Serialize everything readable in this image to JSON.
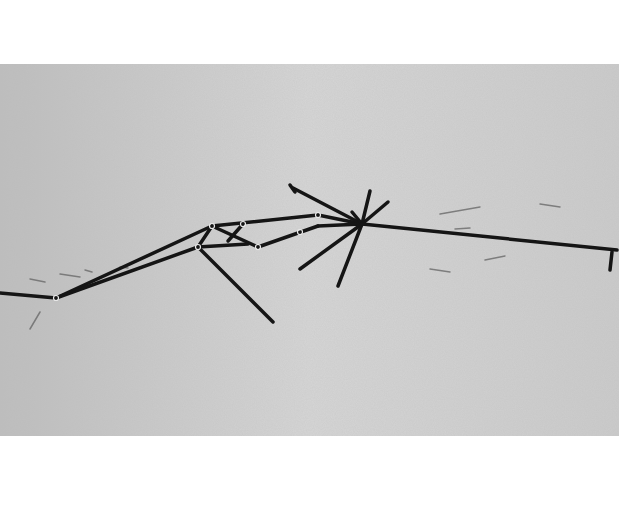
{
  "image": {
    "description": "Grayscale photograph of dark thin sticks/lines radiating across a light gray paper-textured surface",
    "background_color": "#cfcfcf",
    "page_color": "#ffffff",
    "stroke_color": "#151515",
    "photo_bounds": {
      "x": 0,
      "y": 64,
      "width": 619,
      "height": 372
    }
  },
  "segments": [
    {
      "x1": 0,
      "y1": 229,
      "x2": 56,
      "y2": 234
    },
    {
      "x1": 56,
      "y1": 234,
      "x2": 212,
      "y2": 162
    },
    {
      "x1": 56,
      "y1": 234,
      "x2": 198,
      "y2": 183
    },
    {
      "x1": 212,
      "y1": 162,
      "x2": 318,
      "y2": 151
    },
    {
      "x1": 198,
      "y1": 183,
      "x2": 212,
      "y2": 162
    },
    {
      "x1": 198,
      "y1": 183,
      "x2": 273,
      "y2": 258
    },
    {
      "x1": 212,
      "y1": 162,
      "x2": 258,
      "y2": 183
    },
    {
      "x1": 198,
      "y1": 183,
      "x2": 248,
      "y2": 180
    },
    {
      "x1": 243,
      "y1": 160,
      "x2": 228,
      "y2": 177
    },
    {
      "x1": 258,
      "y1": 183,
      "x2": 318,
      "y2": 162
    },
    {
      "x1": 318,
      "y1": 151,
      "x2": 362,
      "y2": 160
    },
    {
      "x1": 318,
      "y1": 162,
      "x2": 362,
      "y2": 160
    },
    {
      "x1": 293,
      "y1": 124,
      "x2": 362,
      "y2": 160
    },
    {
      "x1": 290,
      "y1": 121,
      "x2": 295,
      "y2": 128
    },
    {
      "x1": 362,
      "y1": 160,
      "x2": 370,
      "y2": 127
    },
    {
      "x1": 362,
      "y1": 160,
      "x2": 388,
      "y2": 138
    },
    {
      "x1": 362,
      "y1": 160,
      "x2": 352,
      "y2": 148
    },
    {
      "x1": 362,
      "y1": 160,
      "x2": 300,
      "y2": 205
    },
    {
      "x1": 362,
      "y1": 160,
      "x2": 338,
      "y2": 222
    },
    {
      "x1": 362,
      "y1": 160,
      "x2": 617,
      "y2": 186
    },
    {
      "x1": 612,
      "y1": 188,
      "x2": 610,
      "y2": 206
    }
  ],
  "joints": [
    {
      "cx": 56,
      "cy": 234
    },
    {
      "cx": 198,
      "cy": 183
    },
    {
      "cx": 212,
      "cy": 162
    },
    {
      "cx": 243,
      "cy": 160
    },
    {
      "cx": 258,
      "cy": 183
    },
    {
      "cx": 318,
      "cy": 151
    },
    {
      "cx": 300,
      "cy": 168
    }
  ],
  "marks": [
    {
      "x1": 30,
      "y1": 215,
      "x2": 45,
      "y2": 218
    },
    {
      "x1": 60,
      "y1": 210,
      "x2": 80,
      "y2": 213
    },
    {
      "x1": 85,
      "y1": 206,
      "x2": 92,
      "y2": 208
    },
    {
      "x1": 120,
      "y1": 203,
      "x2": 128,
      "y2": 204
    },
    {
      "x1": 30,
      "y1": 265,
      "x2": 40,
      "y2": 248
    },
    {
      "x1": 440,
      "y1": 150,
      "x2": 480,
      "y2": 143
    },
    {
      "x1": 430,
      "y1": 205,
      "x2": 450,
      "y2": 208
    },
    {
      "x1": 485,
      "y1": 196,
      "x2": 505,
      "y2": 192
    },
    {
      "x1": 455,
      "y1": 165,
      "x2": 470,
      "y2": 164
    },
    {
      "x1": 540,
      "y1": 140,
      "x2": 560,
      "y2": 143
    }
  ]
}
